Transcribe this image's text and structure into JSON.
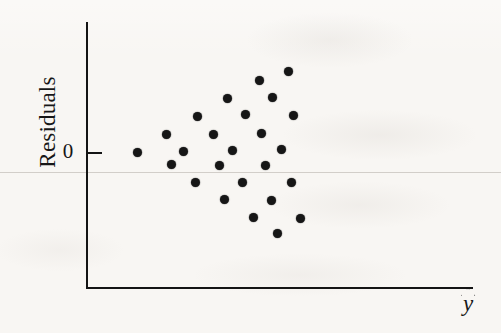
{
  "figure": {
    "kind": "residual-plot",
    "background_color": "#f8f6f3",
    "ink_color": "#161616",
    "width": 501,
    "height": 333
  },
  "labels": {
    "y_axis": "Residuals",
    "x_axis": "ŷ",
    "x_axis_base": "y",
    "zero_tick": "0"
  },
  "axes": {
    "y_axis_top_px": 22,
    "y_axis_bottom_px": 288,
    "y_axis_x_px": 86,
    "x_axis_left_px": 86,
    "x_axis_right_px": 473,
    "x_axis_y_px": 287,
    "zero_line_y_px": 152,
    "tick_length_px": 14
  },
  "bleed_rule_y_px": 172,
  "chart_data": {
    "type": "scatter",
    "title": "",
    "xlabel": "ŷ",
    "ylabel": "Residuals",
    "yticks": [
      0
    ],
    "yticklabels": [
      "0"
    ],
    "xticks": [],
    "xticklabels": [],
    "grid": false,
    "legend": null,
    "marker": "filled-circle",
    "marker_color": "#161616",
    "marker_size_px": 9,
    "n_points": 25,
    "note": "Residuals scattered randomly about zero with no pattern; x and y are unitless pixel-derived positions read off the plot.",
    "points_px": [
      {
        "x": 137,
        "y": 152
      },
      {
        "x": 166,
        "y": 134
      },
      {
        "x": 171,
        "y": 164
      },
      {
        "x": 183,
        "y": 151
      },
      {
        "x": 195,
        "y": 182
      },
      {
        "x": 197,
        "y": 116
      },
      {
        "x": 213,
        "y": 134
      },
      {
        "x": 219,
        "y": 165
      },
      {
        "x": 224,
        "y": 199
      },
      {
        "x": 227,
        "y": 98
      },
      {
        "x": 232,
        "y": 150
      },
      {
        "x": 242,
        "y": 182
      },
      {
        "x": 245,
        "y": 114
      },
      {
        "x": 253,
        "y": 217
      },
      {
        "x": 259,
        "y": 80
      },
      {
        "x": 261,
        "y": 133
      },
      {
        "x": 265,
        "y": 165
      },
      {
        "x": 271,
        "y": 200
      },
      {
        "x": 272,
        "y": 97
      },
      {
        "x": 277,
        "y": 233
      },
      {
        "x": 281,
        "y": 149
      },
      {
        "x": 288,
        "y": 71
      },
      {
        "x": 291,
        "y": 182
      },
      {
        "x": 293,
        "y": 115
      },
      {
        "x": 300,
        "y": 218
      }
    ],
    "x": [
      137,
      166,
      171,
      183,
      195,
      197,
      213,
      219,
      224,
      227,
      232,
      242,
      245,
      253,
      259,
      261,
      265,
      271,
      272,
      277,
      281,
      288,
      291,
      293,
      300
    ],
    "y": [
      0.0,
      0.39,
      -0.26,
      0.02,
      -0.65,
      0.78,
      0.39,
      -0.28,
      -1.02,
      1.17,
      0.04,
      -0.65,
      0.83,
      -1.41,
      1.57,
      0.41,
      -0.28,
      -1.04,
      1.2,
      -1.76,
      0.07,
      1.76,
      -0.65,
      0.8,
      -1.43
    ]
  }
}
